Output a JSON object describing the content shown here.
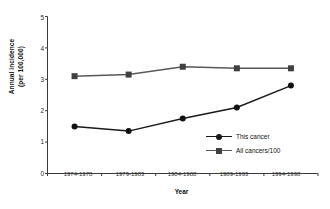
{
  "chart_data": {
    "type": "line",
    "title": "",
    "xlabel": "Year",
    "ylabel_line1": "Annual incidence",
    "ylabel_line2": "(per 100,000)",
    "categories": [
      "1974-1978",
      "1979-1983",
      "1984-1988",
      "1989-1993",
      "1994-1998"
    ],
    "series": [
      {
        "name": "This cancer",
        "values": [
          1.5,
          1.35,
          1.75,
          2.1,
          2.8
        ],
        "color": "#1a1a1a",
        "marker": "diamond"
      },
      {
        "name": "All cancers/100",
        "values": [
          3.1,
          3.15,
          3.4,
          3.35,
          3.35
        ],
        "color": "#595959",
        "marker": "square"
      }
    ],
    "ylim": [
      0,
      5
    ],
    "yticks": [
      "0",
      "1",
      "2",
      "3",
      "4",
      "5"
    ],
    "grid": false,
    "legend_position": "inside-lower-right"
  },
  "legend": {
    "entries": [
      {
        "label": "This cancer"
      },
      {
        "label": "All cancers/100"
      }
    ]
  },
  "title_remnant": "."
}
